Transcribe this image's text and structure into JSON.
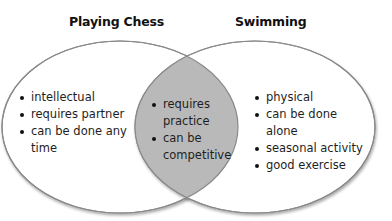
{
  "diagram": {
    "type": "venn",
    "colors": {
      "outline": "#8a8a8a",
      "overlap_fill": "#b9b9b9",
      "background": "#ffffff",
      "text": "#1e1e1e"
    },
    "sets": [
      {
        "title": "Playing Chess",
        "items": [
          "intellectual",
          "requires partner",
          "can be done any time"
        ]
      },
      {
        "title": "Swimming",
        "items": [
          "physical",
          "can be done alone",
          "seasonal activity",
          "good exercise"
        ]
      }
    ],
    "overlap": {
      "items": [
        "requires practice",
        "can be competitive"
      ]
    }
  }
}
